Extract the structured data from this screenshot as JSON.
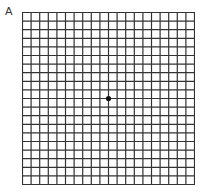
{
  "figure": {
    "panel_label": "A",
    "grid": {
      "rows": 20,
      "cols": 20,
      "line_color": "#333333",
      "center_dot": true,
      "dot_color": "#111111"
    }
  }
}
